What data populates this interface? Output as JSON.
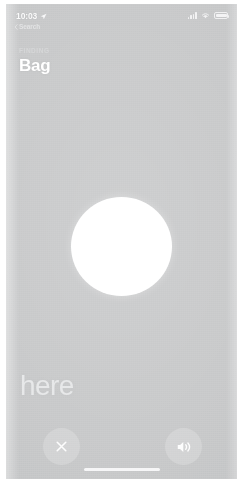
{
  "status_bar": {
    "time": "10:03",
    "location_icon": "location-arrow-icon",
    "back_label": "Search",
    "back_chevron_icon": "chevron-left-icon",
    "cellular_icon": "cellular-bars-icon",
    "wifi_icon": "wifi-icon",
    "battery_icon": "battery-icon"
  },
  "heading": {
    "eyebrow": "FINDING",
    "title": "Bag"
  },
  "precision_finding": {
    "indicator_name": "precision-finding-circle",
    "proximity_text": "here"
  },
  "actions": {
    "close_label": "✕",
    "close_icon": "close-x-icon",
    "sound_icon": "speaker-wave-icon"
  },
  "system": {
    "home_indicator": "home-indicator"
  },
  "colors": {
    "screen_background": "#c9cacb",
    "circle_fill": "#ffffff",
    "title_text": "#ffffff",
    "eyebrow_text": "#d6d7d8",
    "proximity_text": "#e7e8e9",
    "button_background": "rgba(255,255,255,0.20)",
    "frame": "#ffffff"
  }
}
